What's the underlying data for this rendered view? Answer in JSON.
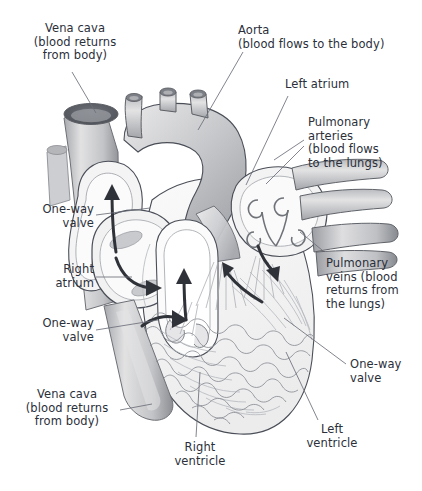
{
  "figure": {
    "kind": "anatomical-illustration",
    "background_color": "#ffffff",
    "label_color": "#2b2f3a",
    "leader_line_color": "#6b6f7a",
    "outline_color": "#4a4e57",
    "arrow_color": "#2f3238",
    "palette": {
      "vessel_light": "#e9e9ea",
      "vessel_mid": "#c9cacd",
      "vessel_dark": "#8e9095",
      "chamber_fill": "#f2f2f3",
      "muscle_fill": "#efeff0",
      "vein_opening": "#55585e"
    }
  },
  "labels": [
    {
      "id": "vena-cava-top",
      "name": "label-vena-cava-superior",
      "text": "Vena cava\n(blood returns\nfrom body)",
      "align": "center",
      "x": 10,
      "y": 22,
      "w": 130
    },
    {
      "id": "aorta",
      "name": "label-aorta",
      "text": "Aorta\n(blood flows to the body)",
      "align": "left",
      "x": 238,
      "y": 24,
      "w": 184
    },
    {
      "id": "left-atrium",
      "name": "label-left-atrium",
      "text": "Left atrium",
      "align": "left",
      "x": 285,
      "y": 78,
      "w": 120
    },
    {
      "id": "pulmonary-arteries",
      "name": "label-pulmonary-arteries",
      "text": "Pulmonary\narteries\n(blood flows\nto the lungs)",
      "align": "left",
      "x": 308,
      "y": 116,
      "w": 114
    },
    {
      "id": "one-way-valve-upper-left",
      "name": "label-one-way-valve-pulmonary",
      "text": "One-way\nvalve",
      "align": "right",
      "x": 8,
      "y": 203,
      "w": 86
    },
    {
      "id": "right-atrium",
      "name": "label-right-atrium",
      "text": "Right\natrium",
      "align": "right",
      "x": 8,
      "y": 263,
      "w": 86
    },
    {
      "id": "one-way-valve-lower-left",
      "name": "label-one-way-valve-tricuspid",
      "text": "One-way\nvalve",
      "align": "right",
      "x": 8,
      "y": 317,
      "w": 86
    },
    {
      "id": "pulmonary-veins",
      "name": "label-pulmonary-veins",
      "text": "Pulmonary\nveins (blood\nreturns from\nthe lungs)",
      "align": "left",
      "x": 326,
      "y": 257,
      "w": 96
    },
    {
      "id": "one-way-valve-right",
      "name": "label-one-way-valve-aortic",
      "text": "One-way\nvalve",
      "align": "left",
      "x": 350,
      "y": 358,
      "w": 72
    },
    {
      "id": "vena-cava-bottom",
      "name": "label-vena-cava-inferior",
      "text": "Vena cava\n(blood returns\nfrom body)",
      "align": "center",
      "x": 2,
      "y": 388,
      "w": 130
    },
    {
      "id": "right-ventricle",
      "name": "label-right-ventricle",
      "text": "Right\nventricle",
      "align": "center",
      "x": 160,
      "y": 441,
      "w": 80
    },
    {
      "id": "left-ventricle",
      "name": "label-left-ventricle",
      "text": "Left\nventricle",
      "align": "center",
      "x": 292,
      "y": 423,
      "w": 80
    }
  ],
  "leader_lines": [
    {
      "name": "leader-vena-cava-superior",
      "from": [
        72,
        72
      ],
      "to": [
        96,
        113
      ]
    },
    {
      "name": "leader-aorta",
      "from": [
        243,
        52
      ],
      "to": [
        198,
        130
      ]
    },
    {
      "name": "leader-left-atrium",
      "from": [
        288,
        96
      ],
      "to": [
        246,
        185
      ]
    },
    {
      "name": "leader-pulmonary-arteries",
      "from": [
        304,
        140
      ],
      "to": [
        274,
        160
      ]
    },
    {
      "name": "leader-pulmonary-arteries-2",
      "from": [
        304,
        146
      ],
      "to": [
        266,
        184
      ]
    },
    {
      "name": "leader-one-way-valve-pulmonary",
      "from": [
        96,
        215
      ],
      "to": [
        150,
        208
      ]
    },
    {
      "name": "leader-right-atrium",
      "from": [
        96,
        277
      ],
      "to": [
        132,
        277
      ]
    },
    {
      "name": "leader-one-way-valve-tricuspid",
      "from": [
        96,
        330
      ],
      "to": [
        158,
        320
      ]
    },
    {
      "name": "leader-pulmonary-veins",
      "from": [
        322,
        250
      ],
      "to": [
        300,
        232
      ]
    },
    {
      "name": "leader-one-way-valve-aortic",
      "from": [
        346,
        364
      ],
      "to": [
        284,
        318
      ]
    },
    {
      "name": "leader-vena-cava-inferior",
      "from": [
        120,
        410
      ],
      "to": [
        152,
        404
      ]
    },
    {
      "name": "leader-right-ventricle",
      "from": [
        196,
        437
      ],
      "to": [
        200,
        372
      ]
    },
    {
      "name": "leader-left-ventricle",
      "from": [
        318,
        420
      ],
      "to": [
        286,
        352
      ]
    }
  ],
  "flow_arrows": [
    {
      "name": "arrow-pulmonary-outflow",
      "description": "upward through pulmonary trunk"
    },
    {
      "name": "arrow-right-atrium-inflow",
      "description": "curving right within right atrium"
    },
    {
      "name": "arrow-right-ventricle-outflow",
      "description": "upward from right ventricle"
    },
    {
      "name": "arrow-inferior-vena-cava-inflow",
      "description": "curving up from inferior vena cava"
    },
    {
      "name": "arrow-left-atrium-inflow",
      "description": "downward into left atrium"
    },
    {
      "name": "arrow-left-ventricle-outflow",
      "description": "curving up toward aorta"
    }
  ]
}
